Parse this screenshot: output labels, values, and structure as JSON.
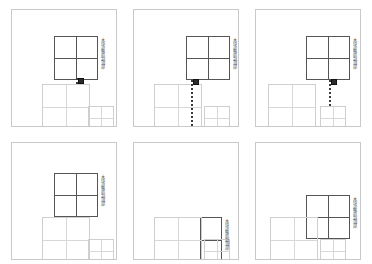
{
  "figure": {
    "background": "#ffffff",
    "panel_border_color": "#c9c9c9",
    "dark_block_color": "#555555",
    "light_block_color": "#d8d8d8",
    "trajectory_color": "#3a3a3a",
    "handle_color": "#2b2b2b"
  },
  "panels": [
    {
      "id": "panel-1",
      "label": "木块被放到顶部",
      "blocks": [
        {
          "name": "held-block-dark",
          "x": 42,
          "y": 26,
          "w": 44,
          "h": 44,
          "tone": "dark"
        },
        {
          "name": "base-block-large",
          "x": 30,
          "y": 74,
          "w": 48,
          "h": 46,
          "tone": "light"
        },
        {
          "name": "base-block-small",
          "x": 76,
          "y": 96,
          "w": 26,
          "h": 24,
          "tone": "light"
        }
      ],
      "trajectory": {
        "x": 64,
        "y_top": 68,
        "y_bottom": 76
      },
      "handle": {
        "x": 66,
        "y": 68
      }
    },
    {
      "id": "panel-2",
      "label": "木块被放到顶部",
      "blocks": [
        {
          "name": "held-block-dark",
          "x": 52,
          "y": 26,
          "w": 44,
          "h": 44,
          "tone": "dark"
        },
        {
          "name": "base-block-large",
          "x": 20,
          "y": 74,
          "w": 48,
          "h": 46,
          "tone": "light"
        },
        {
          "name": "base-block-small",
          "x": 70,
          "y": 96,
          "w": 26,
          "h": 24,
          "tone": "light"
        }
      ],
      "trajectory": {
        "x": 57,
        "y_top": 70,
        "y_bottom": 120
      },
      "handle": {
        "x": 59,
        "y": 69
      }
    },
    {
      "id": "panel-3",
      "label": "木块被放到顶部",
      "blocks": [
        {
          "name": "held-block-dark",
          "x": 50,
          "y": 26,
          "w": 44,
          "h": 44,
          "tone": "dark"
        },
        {
          "name": "base-block-large",
          "x": 12,
          "y": 74,
          "w": 48,
          "h": 46,
          "tone": "light"
        },
        {
          "name": "base-block-small",
          "x": 64,
          "y": 96,
          "w": 26,
          "h": 24,
          "tone": "light"
        }
      ],
      "trajectory": {
        "x": 73,
        "y_top": 70,
        "y_bottom": 96
      },
      "handle": {
        "x": 75,
        "y": 69
      }
    },
    {
      "id": "panel-4",
      "label": "木块被放到顶部",
      "blocks": [
        {
          "name": "held-block-dark",
          "x": 42,
          "y": 30,
          "w": 44,
          "h": 44,
          "tone": "dark"
        },
        {
          "name": "base-block-large",
          "x": 30,
          "y": 74,
          "w": 48,
          "h": 46,
          "tone": "light"
        },
        {
          "name": "base-block-small",
          "x": 76,
          "y": 96,
          "w": 26,
          "h": 24,
          "tone": "light"
        }
      ],
      "trajectory": null,
      "handle": null
    },
    {
      "id": "panel-5",
      "label": "木块被放到顶部",
      "blocks": [
        {
          "name": "held-block-dark",
          "x": 44,
          "y": 74,
          "w": 44,
          "h": 46,
          "tone": "dark"
        },
        {
          "name": "base-block-large",
          "x": 20,
          "y": 74,
          "w": 48,
          "h": 46,
          "tone": "light"
        },
        {
          "name": "base-block-small",
          "x": 70,
          "y": 96,
          "w": 26,
          "h": 24,
          "tone": "light"
        }
      ],
      "trajectory": null,
      "handle": null
    },
    {
      "id": "panel-6",
      "label": "木块被放到顶部",
      "blocks": [
        {
          "name": "held-block-dark",
          "x": 50,
          "y": 52,
          "w": 44,
          "h": 44,
          "tone": "dark"
        },
        {
          "name": "base-block-large",
          "x": 14,
          "y": 74,
          "w": 48,
          "h": 46,
          "tone": "light"
        },
        {
          "name": "base-block-small",
          "x": 64,
          "y": 96,
          "w": 26,
          "h": 24,
          "tone": "light"
        }
      ],
      "trajectory": null,
      "handle": null
    }
  ],
  "layout": {
    "panel_width": 106,
    "panel_height": 118,
    "columns_x": [
      11,
      133,
      255
    ],
    "rows_y": [
      9,
      142
    ],
    "ground_line_y": 120,
    "ground_strip_y": 121,
    "ground_strip_h": 9
  }
}
